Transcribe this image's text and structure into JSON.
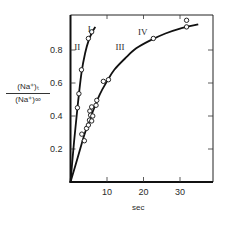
{
  "chart_data": {
    "type": "scatter",
    "title": "",
    "xlabel": "sec",
    "ylabel_numerator": "(Na⁺)ₜ",
    "ylabel_denominator": "(Na⁺)∞",
    "xlim": [
      0,
      39
    ],
    "ylim": [
      0,
      1.0
    ],
    "x_ticks": [
      10,
      20,
      30
    ],
    "x_tick_labels": [
      "10",
      "20",
      "30"
    ],
    "y_ticks": [
      0.2,
      0.4,
      0.6,
      0.8
    ],
    "y_tick_labels": [
      "0.2",
      "0.4",
      "0.6",
      "0.8"
    ],
    "grid": false,
    "legend": "none",
    "annotations": [
      {
        "text": "I",
        "x": 4.7,
        "y": 0.91
      },
      {
        "text": "II",
        "x": 1.0,
        "y": 0.8
      },
      {
        "text": "III",
        "x": 12.3,
        "y": 0.8
      },
      {
        "text": "IV",
        "x": 18.5,
        "y": 0.89
      }
    ],
    "series": [
      {
        "name": "I / II (fast)",
        "marker": "open-circle",
        "points": [
          [
            1.9,
            0.45
          ],
          [
            2.3,
            0.535
          ],
          [
            3.0,
            0.68
          ],
          [
            4.9,
            0.87
          ],
          [
            5.8,
            0.91
          ]
        ],
        "fit_curve": [
          [
            0,
            0
          ],
          [
            1.0,
            0.25
          ],
          [
            2.0,
            0.47
          ],
          [
            3.0,
            0.66
          ],
          [
            4.0,
            0.78
          ],
          [
            5.0,
            0.86
          ],
          [
            6.0,
            0.91
          ],
          [
            6.8,
            0.94
          ]
        ]
      },
      {
        "name": "III / IV (slow)",
        "marker": "open-circle",
        "points": [
          [
            3.1,
            0.29
          ],
          [
            3.8,
            0.25
          ],
          [
            4.4,
            0.325
          ],
          [
            4.9,
            0.345
          ],
          [
            5.2,
            0.375
          ],
          [
            5.3,
            0.43
          ],
          [
            5.5,
            0.405
          ],
          [
            5.8,
            0.37
          ],
          [
            5.8,
            0.455
          ],
          [
            6.1,
            0.4
          ],
          [
            7.0,
            0.465
          ],
          [
            7.2,
            0.495
          ],
          [
            9.0,
            0.61
          ],
          [
            10.4,
            0.62
          ],
          [
            22.7,
            0.87
          ],
          [
            31.8,
            0.98
          ],
          [
            31.8,
            0.94
          ]
        ],
        "fit_curve": [
          [
            0,
            0
          ],
          [
            2,
            0.15
          ],
          [
            4,
            0.3
          ],
          [
            6,
            0.42
          ],
          [
            8,
            0.53
          ],
          [
            10,
            0.61
          ],
          [
            12,
            0.68
          ],
          [
            15,
            0.75
          ],
          [
            18,
            0.81
          ],
          [
            22,
            0.86
          ],
          [
            26,
            0.9
          ],
          [
            30,
            0.93
          ],
          [
            35,
            0.955
          ]
        ]
      }
    ]
  },
  "axis_labels": {
    "x": "sec",
    "y_num": "(Na⁺)ₜ",
    "y_den": "(Na⁺)∞"
  }
}
